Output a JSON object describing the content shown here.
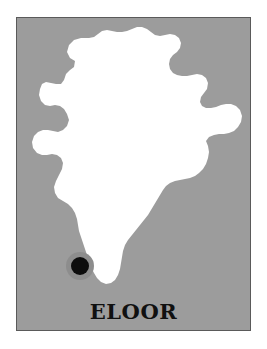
{
  "figure": {
    "kind": "location-map",
    "label": "ELOOR"
  },
  "colors": {
    "page_background": "#ffffff",
    "plate_background": "#9c9c9c",
    "plate_border": "#5a5a5a",
    "country_fill": "#ffffff",
    "marker_fill": "#0d0d0d",
    "marker_halo": "#8d8d8d",
    "label_color": "#101010"
  },
  "plate": {
    "x": 16,
    "y": 17,
    "width": 235,
    "height": 314,
    "border_width": 1
  },
  "marker": {
    "name": "eloor-marker",
    "cx": 63,
    "cy": 248,
    "radius": 9,
    "halo_radius": 14,
    "label": "ELOOR"
  },
  "label": {
    "text": "ELOOR",
    "x_center": 116,
    "baseline_y": 301,
    "font_size_px": 21
  },
  "geometry": {
    "country_name": "India",
    "viewbox": "0 0 233 312",
    "path_note": "Traced silhouette of mainland India including the north-east arm; Bangladesh and Sri Lanka are rendered as background, not filled."
  }
}
